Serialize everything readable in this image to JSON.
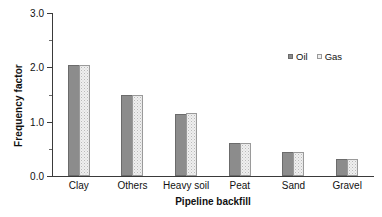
{
  "chart_data": {
    "type": "bar",
    "title": "",
    "xlabel": "Pipeline backfill",
    "ylabel": "Frequency factor",
    "categories": [
      "Clay",
      "Others",
      "Heavy soil",
      "Peat",
      "Sand",
      "Gravel"
    ],
    "series": [
      {
        "name": "Oil",
        "values": [
          2.05,
          1.5,
          1.15,
          0.61,
          0.44,
          0.31
        ],
        "color": "#8c8c8c",
        "pattern": "solid"
      },
      {
        "name": "Gas",
        "values": [
          2.05,
          1.5,
          1.16,
          0.61,
          0.44,
          0.31
        ],
        "color": "#efefef",
        "pattern": "stipple"
      }
    ],
    "ylim": [
      0.0,
      3.0
    ],
    "yticks": [
      "0.0",
      "1.0",
      "2.0",
      "3.0"
    ],
    "ytick_values": [
      0.0,
      1.0,
      2.0,
      3.0
    ],
    "yminor_values": [
      0.5,
      1.5,
      2.5
    ],
    "grid": false,
    "legend_position": "top-right",
    "legend": [
      "Oil",
      "Gas"
    ]
  }
}
